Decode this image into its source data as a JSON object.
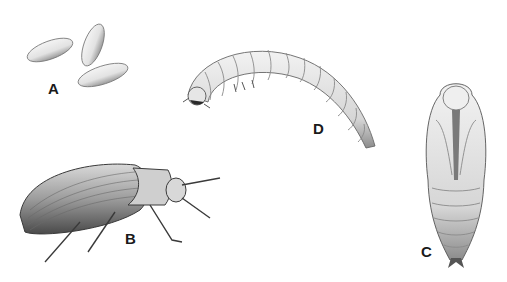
{
  "figure": {
    "type": "illustration",
    "stages": [
      {
        "id": "A",
        "label": "A",
        "name": "eggs",
        "count": 3
      },
      {
        "id": "B",
        "label": "B",
        "name": "adult beetle"
      },
      {
        "id": "C",
        "label": "C",
        "name": "pupa"
      },
      {
        "id": "D",
        "label": "D",
        "name": "larva"
      }
    ],
    "colors": {
      "background": "#ffffff",
      "ink": "#1a1a1a",
      "shade": "#8a8a8a",
      "light": "#e8e8e8"
    }
  }
}
